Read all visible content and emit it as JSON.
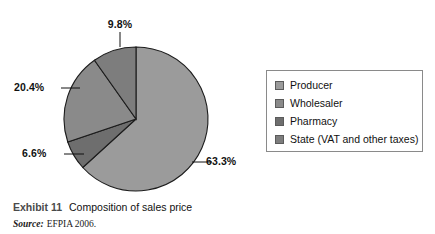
{
  "chart_data": {
    "type": "pie",
    "title": "Composition of sales price",
    "labels": [
      "Producer",
      "Wholesaler",
      "Pharmacy",
      "State (VAT and other taxes)"
    ],
    "values": [
      63.3,
      20.4,
      6.6,
      9.8
    ],
    "value_labels": [
      "63.3%",
      "20.4%",
      "6.6%",
      "9.8%"
    ],
    "unit": "%",
    "colors": [
      "#9b9b9b",
      "#8a8a8a",
      "#6e6e6e",
      "#7d7d7d"
    ],
    "legend_position": "right",
    "grid": false,
    "start_angle_deg": 0,
    "direction": "clockwise",
    "source": "EFPIA 2006."
  },
  "labels": {
    "producer_pct": "63.3%",
    "wholesaler_pct": "20.4%",
    "pharmacy_pct": "6.6%",
    "state_pct": "9.8%"
  },
  "legend": {
    "items": [
      {
        "label": "Producer",
        "color": "#9b9b9b"
      },
      {
        "label": "Wholesaler",
        "color": "#8a8a8a"
      },
      {
        "label": "Pharmacy",
        "color": "#6e6e6e"
      },
      {
        "label": "State (VAT and other taxes)",
        "color": "#7d7d7d"
      }
    ]
  },
  "caption": {
    "exhibit": "Exhibit 11",
    "title": "Composition of sales price",
    "source_word": "Source:",
    "source_text": "EFPIA 2006."
  }
}
